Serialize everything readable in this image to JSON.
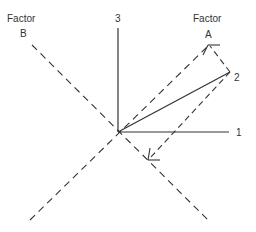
{
  "diagram": {
    "labels": {
      "factor_b_title": "Factor",
      "factor_b_letter": "B",
      "factor_a_title": "Factor",
      "factor_a_letter": "A",
      "axis_1": "1",
      "axis_2": "2",
      "axis_3": "3"
    },
    "colors": {
      "stroke": "#333333",
      "background": "#ffffff"
    }
  }
}
